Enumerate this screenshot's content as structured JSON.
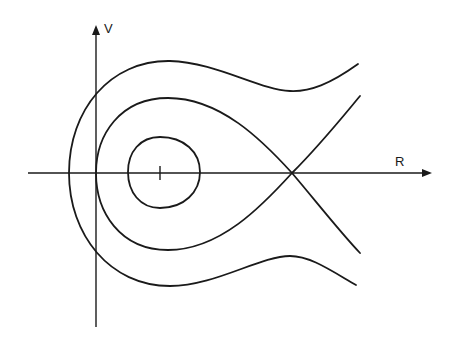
{
  "diagram": {
    "type": "phase-portrait",
    "axes": {
      "horizontal_label": "R",
      "vertical_label": "V"
    },
    "features": [
      "center with closed orbit",
      "nested closed orbits",
      "separatrix through saddle point",
      "unbounded outer orbit"
    ]
  }
}
